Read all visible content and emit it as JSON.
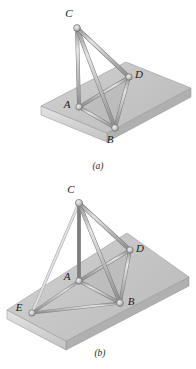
{
  "figure": {
    "background_color": "#ffffff",
    "ink_color": "#1a1a1a"
  },
  "palette": {
    "plate_top": "#c9c9c9",
    "plate_top_light": "#d8d8d8",
    "plate_front": "#d9d9d9",
    "plate_side": "#b4b4b4",
    "plate_edge": "#9a9a9a",
    "member_light": "#e2e2e2",
    "member_mid": "#bdbdbd",
    "member_dark": "#8f8f8f",
    "member_outline": "#7d7d7d",
    "joint_fill": "#cfcfcf",
    "joint_stroke": "#6f6f6f",
    "shadow": "#b0b0b0"
  },
  "panels": [
    {
      "id": "a",
      "caption": "(a)",
      "caption_pos": {
        "x": 98,
        "y": 169
      },
      "plate": {
        "top": [
          {
            "x": 41,
            "y": 106
          },
          {
            "x": 126,
            "y": 62
          },
          {
            "x": 191,
            "y": 88
          },
          {
            "x": 107,
            "y": 133
          }
        ],
        "thickness": 9
      },
      "nodes": [
        {
          "name": "C",
          "x": 77,
          "y": 28,
          "label_x": 69,
          "label_y": 17,
          "radius": 3.4
        },
        {
          "name": "A",
          "x": 79,
          "y": 107,
          "label_x": 67,
          "label_y": 108,
          "radius": 3.2
        },
        {
          "name": "B",
          "x": 115,
          "y": 128,
          "label_x": 110,
          "label_y": 143,
          "radius": 3.4
        },
        {
          "name": "D",
          "x": 129,
          "y": 77,
          "label_x": 136,
          "label_y": 78,
          "radius": 3.2
        }
      ],
      "members": [
        {
          "from": "C",
          "to": "A",
          "width": 3.0
        },
        {
          "from": "C",
          "to": "B",
          "width": 3.2
        },
        {
          "from": "C",
          "to": "D",
          "width": 3.2
        },
        {
          "from": "A",
          "to": "B",
          "width": 2.6
        },
        {
          "from": "A",
          "to": "D",
          "width": 2.6
        },
        {
          "from": "B",
          "to": "D",
          "width": 2.8
        }
      ],
      "shadow_polygon": [
        {
          "x": 79,
          "y": 107
        },
        {
          "x": 115,
          "y": 128
        },
        {
          "x": 129,
          "y": 77
        }
      ]
    },
    {
      "id": "b",
      "caption": "(b)",
      "caption_pos": {
        "x": 100,
        "y": 356
      },
      "plate": {
        "top": [
          {
            "x": 7,
            "y": 310
          },
          {
            "x": 127,
            "y": 233
          },
          {
            "x": 189,
            "y": 277
          },
          {
            "x": 66,
            "y": 341
          }
        ],
        "thickness": 9
      },
      "nodes": [
        {
          "name": "C",
          "x": 79,
          "y": 203,
          "label_x": 71,
          "label_y": 193,
          "radius": 3.6
        },
        {
          "name": "A",
          "x": 79,
          "y": 281,
          "label_x": 67,
          "label_y": 280,
          "radius": 3.2
        },
        {
          "name": "B",
          "x": 120,
          "y": 303,
          "label_x": 128,
          "label_y": 303,
          "radius": 3.4
        },
        {
          "name": "D",
          "x": 130,
          "y": 250,
          "label_x": 137,
          "label_y": 252,
          "radius": 3.2
        },
        {
          "name": "E",
          "x": 32,
          "y": 313,
          "label_x": 19,
          "label_y": 311,
          "radius": 3.2
        }
      ],
      "members": [
        {
          "from": "C",
          "to": "A",
          "width": 3.0
        },
        {
          "from": "C",
          "to": "B",
          "width": 3.2
        },
        {
          "from": "C",
          "to": "D",
          "width": 3.2
        },
        {
          "from": "C",
          "to": "E",
          "width": 2.6
        },
        {
          "from": "A",
          "to": "B",
          "width": 2.6
        },
        {
          "from": "A",
          "to": "D",
          "width": 2.6
        },
        {
          "from": "A",
          "to": "E",
          "width": 2.4
        },
        {
          "from": "B",
          "to": "D",
          "width": 2.8
        },
        {
          "from": "B",
          "to": "E",
          "width": 2.4
        }
      ],
      "shadow_polygon": [
        {
          "x": 79,
          "y": 281
        },
        {
          "x": 120,
          "y": 303
        },
        {
          "x": 130,
          "y": 250
        }
      ]
    }
  ]
}
